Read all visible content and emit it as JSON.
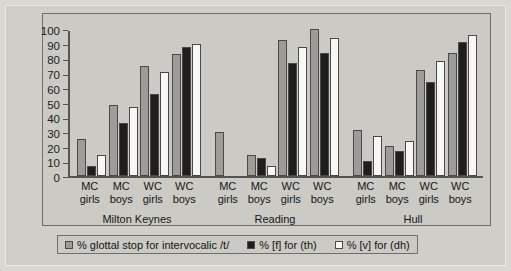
{
  "chart_data": {
    "type": "bar",
    "title": "",
    "xlabel": "",
    "ylabel": "",
    "ylim": [
      0,
      100
    ],
    "yticks": [
      0,
      10,
      20,
      30,
      40,
      50,
      60,
      70,
      80,
      90,
      100
    ],
    "grid": false,
    "legend_position": "bottom",
    "categories": [
      "MC girls",
      "MC boys",
      "WC girls",
      "WC boys",
      "MC girls",
      "MC boys",
      "WC girls",
      "WC boys",
      "MC girls",
      "MC boys",
      "WC girls",
      "WC boys"
    ],
    "groups": [
      {
        "name": "Milton Keynes",
        "categories": [
          {
            "line1": "MC",
            "line2": "girls"
          },
          {
            "line1": "MC",
            "line2": "boys"
          },
          {
            "line1": "WC",
            "line2": "girls"
          },
          {
            "line1": "WC",
            "line2": "boys"
          }
        ],
        "values": {
          "glottal_stop": [
            25,
            48.5,
            75,
            83
          ],
          "f_for_th": [
            7,
            36,
            56,
            88
          ],
          "v_for_dh": [
            14,
            47,
            71,
            90
          ]
        }
      },
      {
        "name": "Reading",
        "categories": [
          {
            "line1": "MC",
            "line2": "girls"
          },
          {
            "line1": "MC",
            "line2": "boys"
          },
          {
            "line1": "WC",
            "line2": "girls"
          },
          {
            "line1": "WC",
            "line2": "boys"
          }
        ],
        "values": {
          "glottal_stop": [
            30,
            14,
            92.5,
            100
          ],
          "f_for_th": [
            0,
            12,
            77,
            84
          ],
          "v_for_dh": [
            0,
            7,
            87.5,
            94
          ]
        }
      },
      {
        "name": "Hull",
        "categories": [
          {
            "line1": "MC",
            "line2": "girls"
          },
          {
            "line1": "MC",
            "line2": "boys"
          },
          {
            "line1": "WC",
            "line2": "girls"
          },
          {
            "line1": "WC",
            "line2": "boys"
          }
        ],
        "values": {
          "glottal_stop": [
            31,
            20.5,
            72,
            83.5
          ],
          "f_for_th": [
            10.5,
            17,
            64,
            91
          ],
          "v_for_dh": [
            27,
            24,
            78.5,
            96
          ]
        }
      }
    ],
    "series": [
      {
        "name": "% glottal stop for intervocalic /t/",
        "key": "glottal_stop",
        "color": "#9d9c98"
      },
      {
        "name": "% [f] for (th)",
        "key": "f_for_th",
        "color": "#1e1e1c"
      },
      {
        "name": "% [v] for (dh)",
        "key": "v_for_dh",
        "color": "#f7f7f5"
      }
    ]
  },
  "legend": {
    "items": [
      {
        "label": "% glottal stop for intervocalic /t/"
      },
      {
        "label": "% [f] for (th)"
      },
      {
        "label": "% [v] for (dh)"
      }
    ]
  },
  "colors": {
    "page_background": "#d9d8d4",
    "panel_background": "#cbcac5",
    "axis": "#55544f",
    "frame": "#6f6e6a",
    "text": "#161614",
    "series_1": "#9d9c98",
    "series_2": "#1e1e1c",
    "series_3": "#f7f7f5"
  }
}
